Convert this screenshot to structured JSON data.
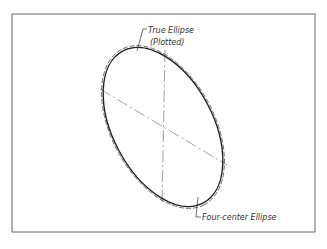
{
  "diagram": {
    "labels": {
      "true_ellipse_line1": "True Ellipse",
      "true_ellipse_line2": "(Plotted)",
      "four_center": "Four-center Ellipse"
    },
    "colors": {
      "frame": "#555555",
      "ink": "#222222",
      "centerline": "#777777"
    }
  }
}
